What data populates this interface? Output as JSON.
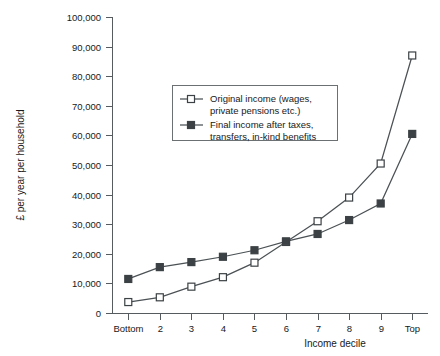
{
  "chart_data": {
    "type": "line",
    "title": "",
    "xlabel": "Income decile",
    "ylabel": "£ per year per household",
    "categories": [
      "Bottom",
      "2",
      "3",
      "4",
      "5",
      "6",
      "7",
      "8",
      "9",
      "Top"
    ],
    "ylim": [
      0,
      100000
    ],
    "yticks": [
      0,
      10000,
      20000,
      30000,
      40000,
      50000,
      60000,
      70000,
      80000,
      90000,
      100000
    ],
    "ytick_labels": [
      "0",
      "10,000",
      "20,000",
      "30,000",
      "40,000",
      "50,000",
      "60,000",
      "70,000",
      "80,000",
      "90,000",
      "100,000"
    ],
    "grid": false,
    "legend_position": "upper-center-left",
    "series": [
      {
        "name": "Original income (wages, private pensions etc.)",
        "marker": "open-square",
        "values": [
          3700,
          5300,
          8900,
          12100,
          17000,
          24000,
          31000,
          39000,
          50500,
          87000
        ]
      },
      {
        "name": "Final income after taxes, transfers, in-kind benefits",
        "marker": "filled-square",
        "values": [
          11500,
          15500,
          17200,
          19000,
          21200,
          24200,
          26700,
          31400,
          37000,
          60500
        ]
      }
    ]
  },
  "legend": {
    "entries": [
      {
        "marker": "open-square",
        "line1": "Original income (wages,",
        "line2": "private pensions etc.)"
      },
      {
        "marker": "filled-square",
        "line1": "Final income after taxes,",
        "line2": "transfers, in-kind benefits"
      }
    ]
  },
  "colors": {
    "series_line": "#4b5154",
    "axis": "#555b5e",
    "text": "#17191a",
    "background": "#ffffff"
  }
}
